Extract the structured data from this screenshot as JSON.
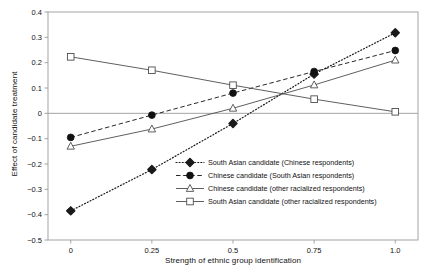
{
  "chart_data": {
    "type": "line",
    "title": "",
    "xlabel": "Strength of ethnic group identification",
    "ylabel": "Effect of candidate treatment",
    "x": [
      0,
      0.25,
      0.5,
      0.75,
      1.0
    ],
    "xticklabels": [
      "0",
      "0.25",
      "0.5",
      "0.75",
      "1.0"
    ],
    "yticklabels": [
      "0.4",
      "0.3",
      "0.2",
      "0.1",
      "0",
      "-0.1",
      "-0.2",
      "-0.3",
      "-0.4",
      "-0.5"
    ],
    "yticks": [
      0.4,
      0.3,
      0.2,
      0.1,
      0,
      -0.1,
      -0.2,
      -0.3,
      -0.4,
      -0.5
    ],
    "xlim": [
      -0.07,
      1.07
    ],
    "ylim": [
      -0.5,
      0.4
    ],
    "grid": false,
    "zero_line": true,
    "legend_position": "center-right-inside",
    "series": [
      {
        "name": "South Asian candidate (Chinese respondents)",
        "marker": "diamond-filled",
        "linestyle": "dotted",
        "color": "#1a1a1a",
        "values": [
          -0.385,
          -0.222,
          -0.04,
          0.155,
          0.318
        ]
      },
      {
        "name": "Chinese candidate (South Asian respondents)",
        "marker": "circle-filled",
        "linestyle": "dashed",
        "color": "#111111",
        "values": [
          -0.095,
          -0.007,
          0.08,
          0.165,
          0.248
        ]
      },
      {
        "name": "Chinese candidate (other racialized respondents)",
        "marker": "triangle-open",
        "linestyle": "solid",
        "color": "#4d4d4d",
        "values": [
          -0.13,
          -0.062,
          0.02,
          0.112,
          0.21
        ]
      },
      {
        "name": "South Asian candidate (other racialized respondents)",
        "marker": "square-open",
        "linestyle": "solid",
        "color": "#4d4d4d",
        "values": [
          0.223,
          0.17,
          0.111,
          0.056,
          0.006
        ]
      }
    ]
  },
  "axes": {
    "frame_color": "#9a9a9a",
    "zero_line_color": "#9a9a9a"
  }
}
